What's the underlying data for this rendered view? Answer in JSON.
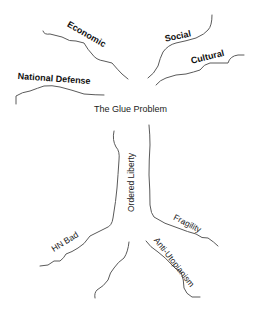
{
  "diagram": {
    "title": "The Glue Problem",
    "branches": [
      {
        "id": "economic",
        "label": "Economic"
      },
      {
        "id": "social",
        "label": "Social"
      },
      {
        "id": "cultural",
        "label": "Cultural"
      },
      {
        "id": "national-defense",
        "label": "National Defense"
      }
    ],
    "trunk": {
      "label": "Ordered Liberty"
    },
    "roots": [
      {
        "id": "hn-bad",
        "label": "HN Bad"
      },
      {
        "id": "fragility",
        "label": "Fragility"
      },
      {
        "id": "anti-utopianism",
        "label": "Anti-Utopianism"
      }
    ],
    "colors": {
      "line": "#5a5a5a",
      "text": "#111111",
      "background": "#ffffff"
    }
  }
}
